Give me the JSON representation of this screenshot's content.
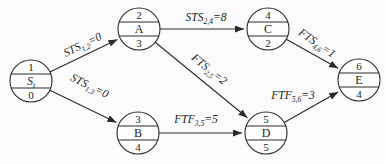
{
  "diagram": {
    "background": "#fbfbfb",
    "node_fill": "#ffffff",
    "stroke_color": "#2a2a2a",
    "text_color": "#1c1c1c",
    "nodes": [
      {
        "id": "S",
        "number": "1",
        "name": "S",
        "name_sub": "t",
        "name_italic": true,
        "duration": "0",
        "x": 31,
        "y": 81,
        "r": 21
      },
      {
        "id": "A",
        "number": "2",
        "name": "A",
        "name_sub": "",
        "name_italic": false,
        "duration": "3",
        "x": 139,
        "y": 29,
        "r": 21
      },
      {
        "id": "B",
        "number": "3",
        "name": "B",
        "name_sub": "",
        "name_italic": false,
        "duration": "4",
        "x": 138,
        "y": 133,
        "r": 21
      },
      {
        "id": "C",
        "number": "4",
        "name": "C",
        "name_sub": "",
        "name_italic": false,
        "duration": "2",
        "x": 268,
        "y": 29,
        "r": 21
      },
      {
        "id": "D",
        "number": "5",
        "name": "D",
        "name_sub": "",
        "name_italic": false,
        "duration": "5",
        "x": 266,
        "y": 133,
        "r": 21
      },
      {
        "id": "E",
        "number": "6",
        "name": "E",
        "name_sub": "",
        "name_italic": false,
        "duration": "4",
        "x": 359,
        "y": 80,
        "r": 21
      }
    ],
    "edges": [
      {
        "from": "S",
        "to": "A",
        "type": "STS",
        "sub": "1,2",
        "value": "0",
        "lx": 84,
        "ly": 48,
        "rotate": -26
      },
      {
        "from": "S",
        "to": "B",
        "type": "STS",
        "sub": "1,3",
        "value": "0",
        "lx": 88,
        "ly": 89,
        "rotate": 26
      },
      {
        "from": "A",
        "to": "C",
        "type": "STS",
        "sub": "2,4",
        "value": "8",
        "lx": 206,
        "ly": 21,
        "rotate": 0
      },
      {
        "from": "A",
        "to": "D",
        "type": "FTS",
        "sub": "2,5",
        "value": "2",
        "lx": 207,
        "ly": 72,
        "rotate": 39
      },
      {
        "from": "B",
        "to": "D",
        "type": "FTF",
        "sub": "3,5",
        "value": "5",
        "lx": 196,
        "ly": 123,
        "rotate": 0
      },
      {
        "from": "C",
        "to": "E",
        "type": "FTS",
        "sub": "4,6",
        "value": "1",
        "lx": 315,
        "ly": 46,
        "rotate": 35
      },
      {
        "from": "D",
        "to": "E",
        "type": "FTF",
        "sub": "5,6",
        "value": "3",
        "lx": 293,
        "ly": 99,
        "rotate": 0
      }
    ]
  }
}
